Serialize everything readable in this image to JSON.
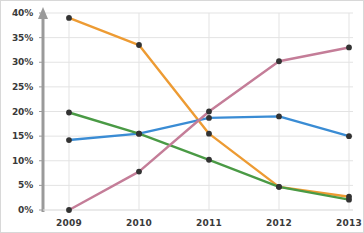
{
  "chart_data": {
    "type": "line",
    "title": "",
    "subtitle": "",
    "xlabel": "",
    "ylabel": "",
    "categories": [
      "2009",
      "2010",
      "2011",
      "2012",
      "2013"
    ],
    "x_tick_labels": [
      "2009",
      "2010",
      "2011",
      "2012",
      "2013"
    ],
    "y_tick_labels": [
      "0%",
      "5%",
      "10%",
      "15%",
      "20%",
      "25%",
      "30%",
      "35%",
      "40%"
    ],
    "y_tick_values": [
      0,
      5,
      10,
      15,
      20,
      25,
      30,
      35,
      40
    ],
    "ylim": [
      0,
      40
    ],
    "grid": true,
    "grid_color": "#e3e3e3",
    "legend": false,
    "legend_position": "none",
    "axis_color": "#9a9a9a",
    "marker_color": "#333333",
    "series": [
      {
        "name": "orange-series",
        "color": "#ed9b33",
        "values": [
          39.0,
          33.5,
          15.5,
          4.7,
          2.7
        ]
      },
      {
        "name": "blue-series",
        "color": "#3a8cd4",
        "values": [
          14.2,
          15.5,
          18.7,
          19.0,
          15.0
        ]
      },
      {
        "name": "green-series",
        "color": "#4a9a45",
        "values": [
          19.8,
          15.5,
          10.2,
          4.7,
          2.1
        ]
      },
      {
        "name": "pink-series",
        "color": "#c47d98",
        "values": [
          0.0,
          7.8,
          20.0,
          30.2,
          33.0
        ]
      }
    ]
  }
}
